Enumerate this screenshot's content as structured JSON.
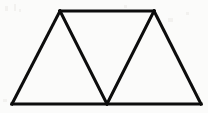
{
  "figure": {
    "background_color": "#fbfbfa",
    "stroke_color": "#0d0d0d",
    "stroke_width": 3,
    "canvas": {
      "width": 208,
      "height": 113
    },
    "vertices": {
      "bottom_left": {
        "label": "bottom-left corner",
        "x": 12,
        "y": 104
      },
      "bottom_middle": {
        "label": "bottom middle vertex",
        "x": 107,
        "y": 104
      },
      "bottom_right": {
        "label": "bottom-right corner",
        "x": 201,
        "y": 104
      },
      "top_left": {
        "label": "top-left apex",
        "x": 60,
        "y": 11
      },
      "top_right": {
        "label": "top-right apex",
        "x": 154,
        "y": 11
      }
    },
    "segments": [
      {
        "name": "bottom-edge",
        "from": "bottom_left",
        "to": "bottom_right",
        "path": "M 12 104 L 201 104"
      },
      {
        "name": "top-edge",
        "from": "top_left",
        "to": "top_right",
        "path": "M 60 11 L 154 11"
      },
      {
        "name": "left-outer-edge",
        "from": "bottom_left",
        "to": "top_left",
        "path": "M 12 104 L 60 11"
      },
      {
        "name": "right-outer-edge",
        "from": "top_right",
        "to": "bottom_right",
        "path": "M 154 11 L 201 104"
      },
      {
        "name": "left-inner-diagonal",
        "from": "top_left",
        "to": "bottom_middle",
        "path": "M 60 11 L 107 104"
      },
      {
        "name": "right-inner-diagonal",
        "from": "bottom_middle",
        "to": "top_right",
        "path": "M 107 104 L 154 11"
      }
    ],
    "outline_path": "M 12 104 L 60 11 L 154 11 L 201 104 Z",
    "inner_v_path": "M 60 11 L 107 104 L 154 11"
  }
}
